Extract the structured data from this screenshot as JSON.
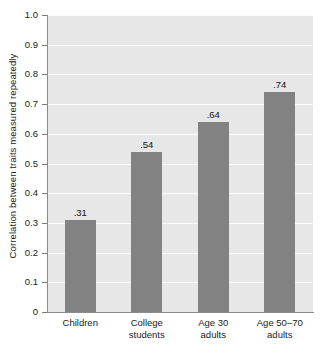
{
  "chart_data": {
    "type": "bar",
    "title": "",
    "subtitle": "",
    "xlabel": "",
    "ylabel": "Correlation between traits measured repeatedly",
    "categories": [
      "Children",
      "College students",
      "Age 30 adults",
      "Age 50–70 adults"
    ],
    "category_lines": [
      [
        "Children"
      ],
      [
        "College",
        "students"
      ],
      [
        "Age 30",
        "adults"
      ],
      [
        "Age 50–70",
        "adults"
      ]
    ],
    "values": [
      0.31,
      0.54,
      0.64,
      0.74
    ],
    "value_labels": [
      ".31",
      ".54",
      ".64",
      ".74"
    ],
    "ylim": [
      0,
      1.0
    ],
    "ytick_values": [
      0,
      0.1,
      0.2,
      0.3,
      0.4,
      0.5,
      0.6,
      0.7,
      0.8,
      0.9,
      1.0
    ],
    "ytick_labels": [
      "0",
      "0.1",
      "0.2",
      "0.3",
      "0.4",
      "0.5",
      "0.6",
      "0.7",
      "0.8",
      "0.9",
      "1.0"
    ],
    "grid": true,
    "grid_orientation": "horizontal",
    "legend": false,
    "legend_position": "none",
    "colors": {
      "bar": "#828282",
      "plot_background": "#e7e7e7",
      "gridline": "#fbfbfb",
      "axis": "#8c8c8c",
      "text": "#1a1a1a",
      "page_background": "#ffffff"
    }
  }
}
